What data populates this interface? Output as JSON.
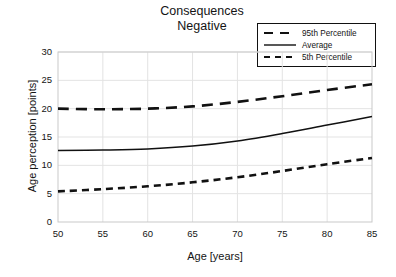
{
  "title": {
    "line1": "Consequences",
    "line2": "Negative"
  },
  "axes": {
    "x_label": "Age [years]",
    "y_label": "Age perception [points]",
    "x_ticks": [
      "50",
      "55",
      "60",
      "65",
      "70",
      "75",
      "80",
      "85"
    ],
    "y_ticks": [
      "0",
      "5",
      "10",
      "15",
      "20",
      "25",
      "30"
    ]
  },
  "legend": {
    "items": [
      {
        "label": "95th Percentile",
        "style": "long-dashed",
        "color": "#111111"
      },
      {
        "label": "Average",
        "style": "solid",
        "color": "#111111"
      },
      {
        "label": "5th Percentile",
        "style": "short-dashed",
        "color": "#111111"
      }
    ]
  },
  "chart_data": {
    "type": "line",
    "title": "Consequences Negative",
    "xlabel": "Age [years]",
    "ylabel": "Age perception [points]",
    "xlim": [
      50,
      85
    ],
    "ylim": [
      0,
      30
    ],
    "xticks": [
      50,
      55,
      60,
      65,
      70,
      75,
      80,
      85
    ],
    "yticks": [
      0,
      5,
      10,
      15,
      20,
      25,
      30
    ],
    "grid": true,
    "legend_position": "top-right",
    "x": [
      50,
      55,
      60,
      65,
      70,
      75,
      80,
      85
    ],
    "series": [
      {
        "name": "95th Percentile",
        "style": "long-dashed",
        "color": "#111111",
        "values": [
          20.0,
          19.9,
          20.0,
          20.4,
          21.2,
          22.2,
          23.3,
          24.3
        ]
      },
      {
        "name": "Average",
        "style": "solid",
        "color": "#111111",
        "values": [
          12.6,
          12.7,
          12.9,
          13.4,
          14.3,
          15.6,
          17.1,
          18.6
        ]
      },
      {
        "name": "5th Percentile",
        "style": "short-dashed",
        "color": "#111111",
        "values": [
          5.4,
          5.8,
          6.3,
          7.0,
          7.9,
          9.0,
          10.2,
          11.3
        ]
      }
    ]
  }
}
